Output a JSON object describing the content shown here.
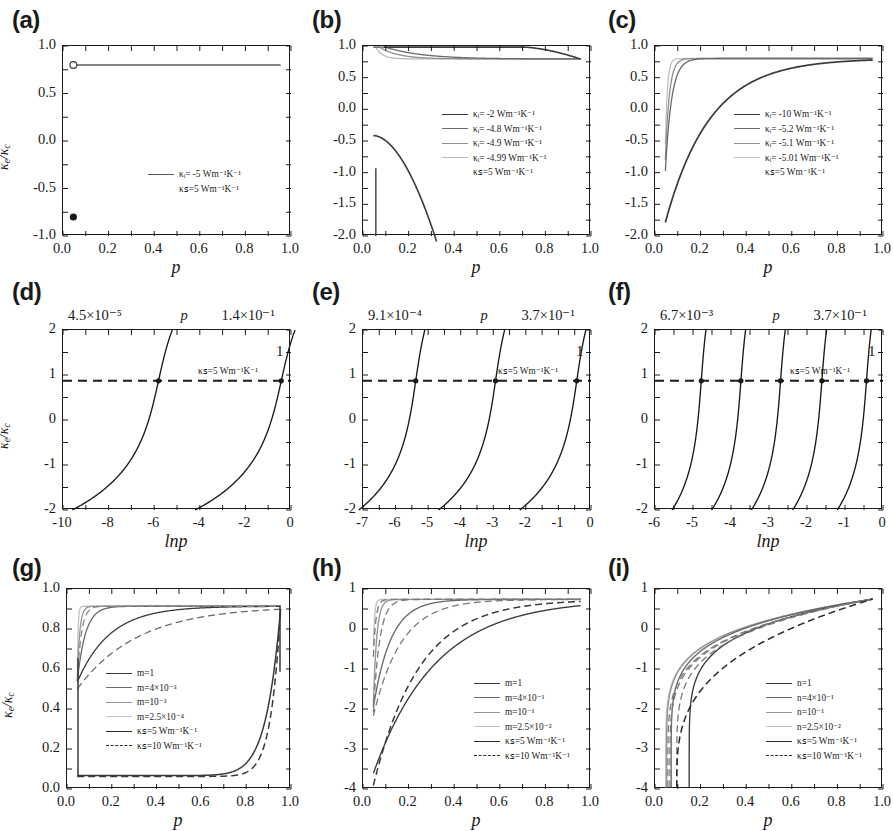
{
  "figure": {
    "type": "multi-panel-line-chart",
    "panels": 9,
    "layout": "3x3",
    "axis_title_p": "p",
    "axis_title_lnp": "lnp",
    "ylabel": "κₑ/κꜱ"
  },
  "chart_data": [
    {
      "id": "a",
      "label": "(a)",
      "type": "line",
      "xlabel": "p",
      "ylabel": "κ_e/κ_c",
      "xlim": [
        -0.05,
        1.05
      ],
      "ylim": [
        -1.25,
        1.25
      ],
      "xticks": [
        "0.0",
        "0.2",
        "0.4",
        "0.6",
        "0.8",
        "1.0"
      ],
      "yticks": [
        "1.0",
        "0.5",
        "0.0",
        "-0.5",
        "-1.0"
      ],
      "grid": false,
      "legend_position": "lower-right",
      "series": [
        {
          "name": "κᵢ= -5 Wm⁻¹K⁻¹",
          "style": "solid",
          "shade": "#555555",
          "values": [
            1.0,
            1.0,
            1.0,
            1.0,
            1.0,
            1.0
          ]
        }
      ],
      "legend": [
        {
          "text": "κᵢ= -5 Wm⁻¹K⁻¹",
          "swatch": "solid",
          "shade": "#555555"
        },
        {
          "text": "κꜱ=5 Wm⁻¹K⁻¹",
          "swatch": "none",
          "shade": "#555555"
        }
      ],
      "markers": [
        {
          "x": 0.0,
          "y": 1.0,
          "style": "open-circle"
        },
        {
          "x": 0.0,
          "y": -1.0,
          "style": "filled-circle"
        }
      ]
    },
    {
      "id": "b",
      "label": "(b)",
      "type": "line",
      "xlabel": "p",
      "ylabel": "κ_e/κ_c",
      "xlim": [
        -0.05,
        1.05
      ],
      "ylim": [
        -2.25,
        1.25
      ],
      "xticks": [
        "0.0",
        "0.2",
        "0.4",
        "0.6",
        "0.8",
        "1.0"
      ],
      "yticks": [
        "1.0",
        "0.5",
        "0.0",
        "-0.5",
        "-1.0",
        "-1.5",
        "-2.0"
      ],
      "grid": false,
      "legend_position": "center-right",
      "legend": [
        {
          "text": "κᵢ= -2 Wm⁻¹K⁻¹",
          "swatch": "solid",
          "shade": "#3a3a3a"
        },
        {
          "text": "κᵢ= -4.8 Wm⁻¹K⁻¹",
          "swatch": "solid",
          "shade": "#6a6a6a"
        },
        {
          "text": "κᵢ= -4.9 Wm⁻¹K⁻¹",
          "swatch": "solid",
          "shade": "#8f8f8f"
        },
        {
          "text": "κᵢ= -4.99 Wm⁻¹K⁻¹",
          "swatch": "solid",
          "shade": "#b9b9b9"
        },
        {
          "text": "κꜱ=5 Wm⁻¹K⁻¹",
          "swatch": "none",
          "shade": "#555555"
        }
      ]
    },
    {
      "id": "c",
      "label": "(c)",
      "type": "line",
      "xlabel": "p",
      "ylabel": "κ_e/κ_c",
      "xlim": [
        -0.05,
        1.05
      ],
      "ylim": [
        -2.25,
        1.25
      ],
      "xticks": [
        "0.0",
        "0.2",
        "0.4",
        "0.6",
        "0.8",
        "1.0"
      ],
      "yticks": [
        "1.0",
        "0.5",
        "0.0",
        "-0.5",
        "-1.0",
        "-1.5",
        "-2.0"
      ],
      "grid": false,
      "legend_position": "center-right",
      "legend": [
        {
          "text": "κᵢ= -10 Wm⁻¹K⁻¹",
          "swatch": "solid",
          "shade": "#3a3a3a"
        },
        {
          "text": "κᵢ= -5.2 Wm⁻¹K⁻¹",
          "swatch": "solid",
          "shade": "#6a6a6a"
        },
        {
          "text": "κᵢ= -5.1 Wm⁻¹K⁻¹",
          "swatch": "solid",
          "shade": "#8f8f8f"
        },
        {
          "text": "κᵢ= -5.01 Wm⁻¹K⁻¹",
          "swatch": "solid",
          "shade": "#c2c2c2"
        },
        {
          "text": "κꜱ=5 Wm⁻¹K⁻¹",
          "swatch": "none",
          "shade": "#555555"
        }
      ]
    },
    {
      "id": "d",
      "label": "(d)",
      "type": "line",
      "xlabel": "lnp",
      "ylabel": "κ_e/κ_c",
      "xlim": [
        -11.2,
        0.5
      ],
      "ylim": [
        -2.3,
        2.3
      ],
      "xticks": [
        "-10",
        "-8",
        "-6",
        "-4",
        "-2",
        "0"
      ],
      "yticks": [
        "2",
        "1",
        "0",
        "-1",
        "-2"
      ],
      "grid": false,
      "hline": {
        "y": 1,
        "style": "dashed"
      },
      "top_annotations": [
        "4.5×10⁻⁵",
        "p",
        "1.4×10⁻¹"
      ],
      "right_annotation": "1",
      "inner_annotation": "κꜱ=5 Wm⁻¹K⁻¹",
      "crossings": [
        -6.3,
        0.0
      ],
      "curves": 2
    },
    {
      "id": "e",
      "label": "(e)",
      "type": "line",
      "xlabel": "lnp",
      "ylabel": "κ_e/κ_c",
      "xlim": [
        -7.5,
        0.5
      ],
      "ylim": [
        -2.3,
        2.3
      ],
      "xticks": [
        "-7",
        "-6",
        "-5",
        "-4",
        "-3",
        "-2",
        "-1",
        "0"
      ],
      "yticks": [
        "2",
        "1",
        "0",
        "-1",
        "-2"
      ],
      "grid": false,
      "hline": {
        "y": 1,
        "style": "dashed"
      },
      "top_annotations": [
        "9.1×10⁻⁴",
        "p",
        "3.7×10⁻¹"
      ],
      "right_annotation": "1",
      "inner_annotation": "κꜱ=5 Wm⁻¹K⁻¹",
      "crossings": [
        -5.65,
        -2.85,
        0.0
      ],
      "curves": 3
    },
    {
      "id": "f",
      "label": "(f)",
      "type": "line",
      "xlabel": "lnp",
      "ylabel": "κ_e/κ_c",
      "xlim": [
        -6.4,
        0.5
      ],
      "ylim": [
        -2.3,
        2.3
      ],
      "xticks": [
        "-6",
        "-5",
        "-4",
        "-3",
        "-2",
        "-1",
        "0"
      ],
      "yticks": [
        "2",
        "1",
        "0",
        "-1",
        "-2"
      ],
      "grid": false,
      "hline": {
        "y": 1,
        "style": "dashed"
      },
      "top_annotations": [
        "6.7×10⁻³",
        "p",
        "3.7×10⁻¹"
      ],
      "right_annotation": "1",
      "inner_annotation": "κꜱ=5 Wm⁻¹K⁻¹",
      "crossings": [
        -5.0,
        -3.8,
        -2.6,
        -1.35,
        0.0
      ],
      "curves": 5
    },
    {
      "id": "g",
      "label": "(g)",
      "type": "line",
      "xlabel": "p",
      "ylabel": "κ_e/κ_c",
      "xlim": [
        -0.05,
        1.05
      ],
      "ylim": [
        -0.06,
        1.1
      ],
      "xticks": [
        "0.0",
        "0.2",
        "0.4",
        "0.6",
        "0.8",
        "1.0"
      ],
      "yticks": [
        "1.0",
        "0.8",
        "0.6",
        "0.4",
        "0.2",
        "0.0"
      ],
      "grid": false,
      "legend_position": "center-left",
      "legend": [
        {
          "text": "m=1",
          "swatch": "solid",
          "shade": "#3a3a3a"
        },
        {
          "text": "m=4×10⁻³",
          "swatch": "solid",
          "shade": "#6a6a6a"
        },
        {
          "text": "m=10⁻³",
          "swatch": "solid",
          "shade": "#949494"
        },
        {
          "text": "m=2.5×10⁻⁴",
          "swatch": "solid",
          "shade": "#c2c2c2"
        },
        {
          "text": "κꜱ=5 Wm⁻¹K⁻¹",
          "swatch": "solid",
          "shade": "#2a2a2a"
        },
        {
          "text": "κꜱ=10 Wm⁻¹K⁻¹",
          "swatch": "dashed",
          "shade": "#2a2a2a"
        }
      ]
    },
    {
      "id": "h",
      "label": "(h)",
      "type": "line",
      "xlabel": "p",
      "ylabel": "κ_e/κ_c",
      "xlim": [
        -0.05,
        1.05
      ],
      "ylim": [
        -4.4,
        1.35
      ],
      "xticks": [
        "0.0",
        "0.2",
        "0.4",
        "0.6",
        "0.8",
        "1.0"
      ],
      "yticks": [
        "1",
        "0",
        "-1",
        "-2",
        "-3",
        "-4"
      ],
      "grid": false,
      "legend_position": "center-right",
      "legend": [
        {
          "text": "m=1",
          "swatch": "solid",
          "shade": "#3a3a3a"
        },
        {
          "text": "m=4×10⁻¹",
          "swatch": "solid",
          "shade": "#6a6a6a"
        },
        {
          "text": "m=10⁻¹",
          "swatch": "solid",
          "shade": "#949494"
        },
        {
          "text": "m=2.5×10⁻²",
          "swatch": "solid",
          "shade": "#c2c2c2"
        },
        {
          "text": "κꜱ=5 Wm⁻¹K⁻¹",
          "swatch": "solid",
          "shade": "#2a2a2a"
        },
        {
          "text": "κꜱ=10 Wm⁻¹K⁻¹",
          "swatch": "dashed",
          "shade": "#2a2a2a"
        }
      ]
    },
    {
      "id": "i",
      "label": "(i)",
      "type": "line",
      "xlabel": "p",
      "ylabel": "κ_e/κ_c",
      "xlim": [
        -0.05,
        1.05
      ],
      "ylim": [
        -4.6,
        1.35
      ],
      "xticks": [
        "0.0",
        "0.2",
        "0.4",
        "0.6",
        "0.8",
        "1.0"
      ],
      "yticks": [
        "1",
        "0",
        "-1",
        "-2",
        "-3",
        "-4"
      ],
      "grid": false,
      "legend_position": "center-right",
      "legend": [
        {
          "text": "n=1",
          "swatch": "solid",
          "shade": "#3a3a3a"
        },
        {
          "text": "n=4×10⁻¹",
          "swatch": "solid",
          "shade": "#6a6a6a"
        },
        {
          "text": "n=10⁻¹",
          "swatch": "solid",
          "shade": "#949494"
        },
        {
          "text": "n=2.5×10⁻²",
          "swatch": "solid",
          "shade": "#c2c2c2"
        },
        {
          "text": "κꜱ=5 Wm⁻¹K⁻¹",
          "swatch": "solid",
          "shade": "#2a2a2a"
        },
        {
          "text": "κꜱ=10 Wm⁻¹K⁻¹",
          "swatch": "dashed",
          "shade": "#2a2a2a"
        }
      ]
    }
  ]
}
